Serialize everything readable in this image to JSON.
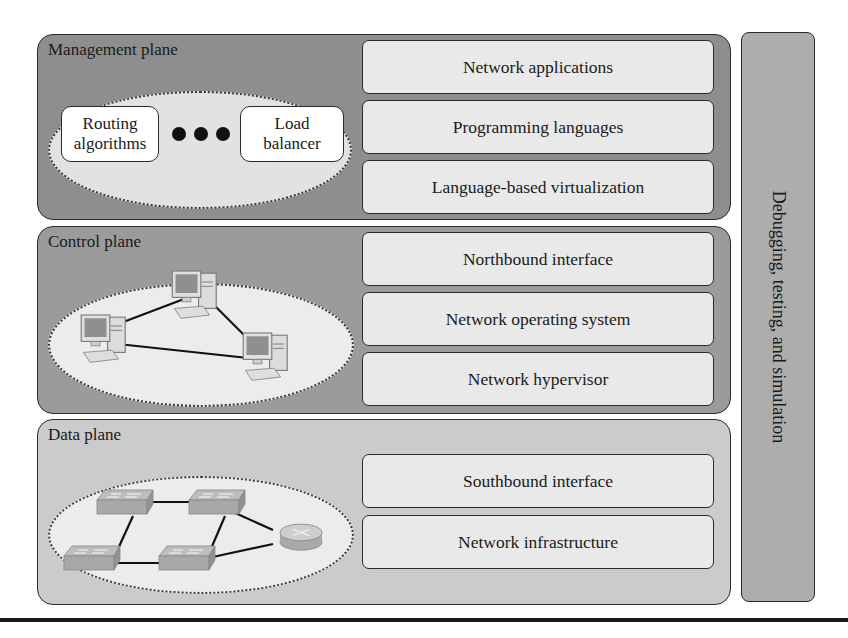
{
  "diagram": {
    "side_bar": {
      "label": "Debugging, testing, and simulation"
    },
    "planes": [
      {
        "title": "Management plane",
        "illustration": {
          "left_box": [
            "Routing",
            "algorithms"
          ],
          "right_box": [
            "Load",
            "balancer"
          ],
          "ellipsis": "•••"
        },
        "layers": [
          "Network applications",
          "Programming languages",
          "Language-based virtualization"
        ]
      },
      {
        "title": "Control plane",
        "illustration": {
          "type": "three networked computers (controllers)"
        },
        "layers": [
          "Northbound interface",
          "Network operating system",
          "Network hypervisor"
        ]
      },
      {
        "title": "Data plane",
        "illustration": {
          "type": "four switches and one router"
        },
        "layers": [
          "Southbound interface",
          "Network infrastructure"
        ]
      }
    ],
    "colors": {
      "management_plane_fill": "#8e8e8e",
      "control_plane_fill": "#9b9b9b",
      "data_plane_fill": "#cbcbcb",
      "layer_fill": "#e9e9e9",
      "side_bar_fill": "#adadad",
      "stroke": "#2b2b2b"
    }
  }
}
